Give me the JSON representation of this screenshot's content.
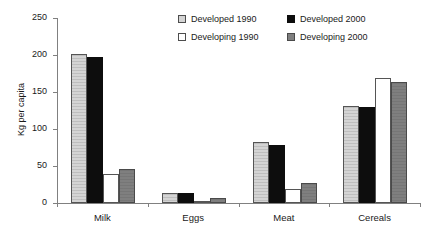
{
  "chart_data": {
    "type": "bar",
    "title": "",
    "xlabel": "",
    "ylabel": "Kg per capita",
    "categories": [
      "Milk",
      "Eggs",
      "Meat",
      "Cereals"
    ],
    "ylim": [
      0,
      250
    ],
    "yticks": [
      0,
      50,
      100,
      150,
      200,
      250
    ],
    "grid": false,
    "legend_position": "top-center",
    "series": [
      {
        "name": "Developed 1990",
        "color": "#d4d4d4",
        "values": [
          202,
          14,
          82,
          131
        ]
      },
      {
        "name": "Developed 2000",
        "color": "#0d0d0d",
        "values": [
          197,
          13,
          78,
          130
        ]
      },
      {
        "name": "Developing 1990",
        "color": "#ffffff",
        "values": [
          39,
          3,
          19,
          169
        ]
      },
      {
        "name": "Developing 2000",
        "color": "#7f7f7f",
        "values": [
          46,
          7,
          27,
          164
        ]
      }
    ]
  },
  "axis": {
    "y_title": "Kg per capita",
    "y_tick_labels": [
      "250",
      "200",
      "150",
      "100",
      "50",
      "0"
    ],
    "x_tick_labels": [
      "Milk",
      "Eggs",
      "Meat",
      "Cereals"
    ]
  },
  "legend": {
    "items": [
      {
        "label": "Developed 1990",
        "swatch": "#d4d4d4"
      },
      {
        "label": "Developed 2000",
        "swatch": "#0d0d0d"
      },
      {
        "label": "Developing 1990",
        "swatch": "#ffffff"
      },
      {
        "label": "Developing 2000",
        "swatch": "#7f7f7f"
      }
    ]
  }
}
